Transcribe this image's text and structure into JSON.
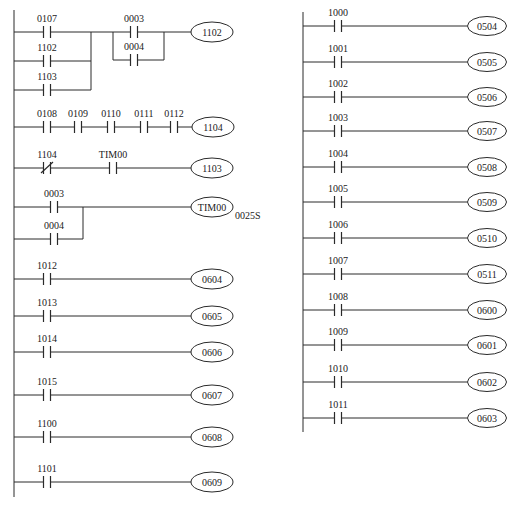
{
  "diagram": {
    "type": "plc-ladder-diagram",
    "colors": {
      "line": "#2a2a2a",
      "text": "#222222",
      "background": "#ffffff"
    },
    "left_column": {
      "rail": {
        "x": 14,
        "y1": 10,
        "y2": 497
      },
      "rungs": [
        {
          "id": "rung-1102",
          "y": 32,
          "coil": {
            "label": "1102",
            "cx": 212,
            "rx": 21,
            "ry": 10
          },
          "parallel_blocks": [
            {
              "x_left": 14,
              "x_join": 91,
              "branches": [
                {
                  "y": 32,
                  "contacts": [
                    {
                      "label": "0107",
                      "x": 47,
                      "type": "NO"
                    }
                  ]
                },
                {
                  "y": 61,
                  "contacts": [
                    {
                      "label": "1102",
                      "x": 47,
                      "type": "NO"
                    }
                  ]
                },
                {
                  "y": 90,
                  "contacts": [
                    {
                      "label": "1103",
                      "x": 47,
                      "type": "NO"
                    }
                  ]
                }
              ]
            },
            {
              "x_left": 113,
              "x_join": 164,
              "branches": [
                {
                  "y": 32,
                  "contacts": [
                    {
                      "label": "0003",
                      "x": 134,
                      "type": "NO"
                    }
                  ]
                },
                {
                  "y": 60,
                  "contacts": [
                    {
                      "label": "0004",
                      "x": 134,
                      "type": "NO"
                    }
                  ]
                }
              ]
            }
          ]
        },
        {
          "id": "rung-1104",
          "y": 127,
          "coil": {
            "label": "1104",
            "cx": 213,
            "rx": 21,
            "ry": 10
          },
          "contacts": [
            {
              "label": "0108",
              "x": 47,
              "type": "NO"
            },
            {
              "label": "0109",
              "x": 78,
              "type": "NO"
            },
            {
              "label": "0110",
              "x": 111,
              "type": "NO"
            },
            {
              "label": "0111",
              "x": 144,
              "type": "NO"
            },
            {
              "label": "0112",
              "x": 174,
              "type": "NO"
            }
          ]
        },
        {
          "id": "rung-1103",
          "y": 168,
          "coil": {
            "label": "1103",
            "cx": 212,
            "rx": 21,
            "ry": 10
          },
          "contacts": [
            {
              "label": "1104",
              "x": 47,
              "type": "NC"
            },
            {
              "label": "TIM00",
              "x": 113,
              "type": "NO"
            }
          ]
        },
        {
          "id": "rung-tim00",
          "y": 207,
          "coil": {
            "label": "TIM00",
            "cx": 212,
            "rx": 21,
            "ry": 10,
            "setting": "0025S"
          },
          "parallel_blocks": [
            {
              "x_left": 14,
              "x_join": 83,
              "branches": [
                {
                  "y": 207,
                  "contacts": [
                    {
                      "label": "0003",
                      "x": 54,
                      "type": "NO"
                    }
                  ]
                },
                {
                  "y": 239,
                  "contacts": [
                    {
                      "label": "0004",
                      "x": 54,
                      "type": "NO"
                    }
                  ]
                }
              ]
            }
          ]
        },
        {
          "id": "rung-0604",
          "y": 279,
          "coil": {
            "label": "0604",
            "cx": 212,
            "rx": 21,
            "ry": 10
          },
          "contacts": [
            {
              "label": "1012",
              "x": 47,
              "type": "NO"
            }
          ]
        },
        {
          "id": "rung-0605",
          "y": 316,
          "coil": {
            "label": "0605",
            "cx": 212,
            "rx": 21,
            "ry": 10
          },
          "contacts": [
            {
              "label": "1013",
              "x": 47,
              "type": "NO"
            }
          ]
        },
        {
          "id": "rung-0606",
          "y": 352,
          "coil": {
            "label": "0606",
            "cx": 212,
            "rx": 21,
            "ry": 10
          },
          "contacts": [
            {
              "label": "1014",
              "x": 47,
              "type": "NO"
            }
          ]
        },
        {
          "id": "rung-0607",
          "y": 395,
          "coil": {
            "label": "0607",
            "cx": 212,
            "rx": 21,
            "ry": 10
          },
          "contacts": [
            {
              "label": "1015",
              "x": 47,
              "type": "NO"
            }
          ]
        },
        {
          "id": "rung-0608",
          "y": 437,
          "coil": {
            "label": "0608",
            "cx": 212,
            "rx": 21,
            "ry": 10
          },
          "contacts": [
            {
              "label": "1100",
              "x": 47,
              "type": "NO"
            }
          ]
        },
        {
          "id": "rung-0609",
          "y": 482,
          "coil": {
            "label": "0609",
            "cx": 212,
            "rx": 21,
            "ry": 10
          },
          "contacts": [
            {
              "label": "1101",
              "x": 47,
              "type": "NO"
            }
          ]
        }
      ]
    },
    "right_column": {
      "rail": {
        "x": 303,
        "y1": 12,
        "y2": 432
      },
      "coil_cx": 487,
      "contact_x": 338,
      "rungs": [
        {
          "id": "rung-0504",
          "y": 26,
          "contact": "1000",
          "coil": "0504"
        },
        {
          "id": "rung-0505",
          "y": 62,
          "contact": "1001",
          "coil": "0505"
        },
        {
          "id": "rung-0506",
          "y": 97,
          "contact": "1002",
          "coil": "0506"
        },
        {
          "id": "rung-0507",
          "y": 131,
          "contact": "1003",
          "coil": "0507"
        },
        {
          "id": "rung-0508",
          "y": 167,
          "contact": "1004",
          "coil": "0508"
        },
        {
          "id": "rung-0509",
          "y": 202,
          "contact": "1005",
          "coil": "0509"
        },
        {
          "id": "rung-0510",
          "y": 238,
          "contact": "1006",
          "coil": "0510"
        },
        {
          "id": "rung-0511",
          "y": 274,
          "contact": "1007",
          "coil": "0511"
        },
        {
          "id": "rung-0600",
          "y": 310,
          "contact": "1008",
          "coil": "0600"
        },
        {
          "id": "rung-0601",
          "y": 345,
          "contact": "1009",
          "coil": "0601"
        },
        {
          "id": "rung-0602",
          "y": 382,
          "contact": "1010",
          "coil": "0602"
        },
        {
          "id": "rung-0603",
          "y": 418,
          "contact": "1011",
          "coil": "0603"
        }
      ]
    }
  }
}
